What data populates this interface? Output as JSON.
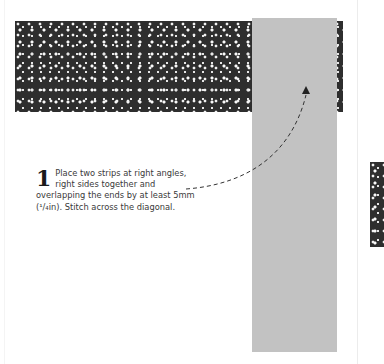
{
  "illustration": {
    "patterned_strip": "black-and-white floral fabric strip (horizontal)",
    "plain_strip": "grey fabric strip (vertical)",
    "colors": {
      "plain_strip": "#c2c2c2",
      "pattern_dark": "#2e2e2e",
      "pattern_light": "#f2f2f2",
      "text": "#3a3a3a"
    }
  },
  "instruction": {
    "step_number": "1",
    "text": "Place two strips at right angles, right sides together and overlapping the ends by at least 5mm (¹/₄in). Stitch across the diagonal."
  }
}
